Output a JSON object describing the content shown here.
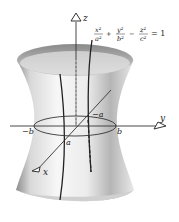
{
  "diagram": {
    "equation": {
      "terms": [
        {
          "sign": "",
          "num": "x²",
          "den": "a²"
        },
        {
          "sign": "+",
          "num": "y²",
          "den": "b²"
        },
        {
          "sign": "−",
          "num": "z²",
          "den": "c²"
        }
      ],
      "rhs": "= 1"
    },
    "axes": {
      "z": "z",
      "y": "y",
      "x": "x"
    },
    "labels": {
      "neg_b": "−b",
      "pos_b": "b",
      "pos_a": "a",
      "neg_a": "−a"
    },
    "colors": {
      "surface_light": "#f4f4f4",
      "surface_dark": "#9a9a9a",
      "line": "#222222"
    }
  }
}
